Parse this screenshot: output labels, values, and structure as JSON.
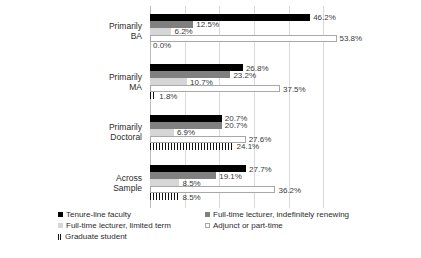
{
  "chart_data": {
    "type": "bar",
    "orientation": "horizontal",
    "title": "",
    "subtitle": "",
    "xlabel": "",
    "ylabel": "",
    "xlim": [
      0,
      60
    ],
    "grid": true,
    "gridlines": [
      0,
      10,
      20,
      30,
      40,
      50
    ],
    "legend_position": "bottom",
    "categories": [
      "Primarily\nBA",
      "Primarily\nMA",
      "Primarily\nDoctoral",
      "Across\nSample"
    ],
    "category_lines": [
      [
        "Primarily",
        "BA"
      ],
      [
        "Primarily",
        "MA"
      ],
      [
        "Primarily",
        "Doctoral"
      ],
      [
        "Across",
        "Sample"
      ]
    ],
    "series": [
      {
        "name": "Tenure-line faculty",
        "color": "#000000",
        "values": [
          46.2,
          26.8,
          20.7,
          27.7
        ],
        "labels": [
          "46.2%",
          "26.8%",
          "20.7%",
          "27.7%"
        ]
      },
      {
        "name": "Full-time lecturer, indefinitely renewing",
        "color": "#808080",
        "values": [
          12.5,
          23.2,
          20.7,
          19.1
        ],
        "labels": [
          "12.5%",
          "23.2%",
          "20.7%",
          "19.1%"
        ]
      },
      {
        "name": "Full-time lecturer, limited term",
        "color": "#d6d6d6",
        "values": [
          6.2,
          10.7,
          6.9,
          8.5
        ],
        "labels": [
          "6.2%",
          "10.7%",
          "6.9%",
          "8.5%"
        ]
      },
      {
        "name": "Adjunct or part-time",
        "color": "#ffffff",
        "values": [
          53.8,
          37.5,
          27.6,
          36.2
        ],
        "labels": [
          "53.8%",
          "37.5%",
          "27.6%",
          "36.2%"
        ]
      },
      {
        "name": "Graduate student",
        "color": "hatched",
        "values": [
          0.0,
          1.8,
          24.1,
          8.5
        ],
        "labels": [
          "0.0%",
          "1.8%",
          "24.1%",
          "8.5%"
        ]
      }
    ]
  },
  "legend": {
    "items": [
      {
        "label": "Tenure-line faculty",
        "swatch": "k0"
      },
      {
        "label": "Full-time lecturer, indefinitely renewing",
        "swatch": "k1"
      },
      {
        "label": "Full-time lecturer, limited term",
        "swatch": "k2"
      },
      {
        "label": "Adjunct or part-time",
        "swatch": "k3"
      },
      {
        "label": "Graduate student",
        "swatch": "k4"
      }
    ]
  }
}
